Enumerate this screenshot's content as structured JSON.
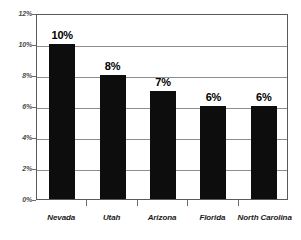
{
  "chart_data": {
    "type": "bar",
    "title": "",
    "subtitle": "",
    "xlabel": "",
    "ylabel": "",
    "categories": [
      "Nevada",
      "Utah",
      "Arizona",
      "Florida",
      "North Carolina"
    ],
    "values": [
      10,
      8,
      7,
      6,
      6
    ],
    "value_labels": [
      "10%",
      "8%",
      "7%",
      "6%",
      "6%"
    ],
    "ylim": [
      0,
      12
    ],
    "ytick_values": [
      0,
      2,
      4,
      6,
      8,
      10,
      12
    ],
    "ytick_labels": [
      "0%",
      "2%",
      "4%",
      "6%",
      "8%",
      "10%",
      "12%"
    ],
    "grid": true,
    "grid_axis": "y",
    "legend": null,
    "legend_position": "none",
    "bar_color": "#0d0d0d",
    "frame_color": "#5a5a5a",
    "gridline_color": "#8d8d8d",
    "background_color": "#ffffff",
    "annotations": []
  }
}
